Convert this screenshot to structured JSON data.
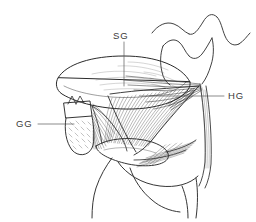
{
  "figure": {
    "background_color": "#ffffff",
    "ink_color": "#2b2b2b",
    "label_color": "#3a3a3a",
    "width": 256,
    "height": 222
  },
  "labels": [
    {
      "id": "sg",
      "text": "SG",
      "meaning": "styloglossus",
      "x": 113,
      "y": 31,
      "leader": {
        "type": "vertical",
        "x1": 124,
        "y1": 42,
        "x2": 124,
        "y2": 86
      }
    },
    {
      "id": "hg",
      "text": "HG",
      "meaning": "hyoglossus",
      "x": 228,
      "y": 91,
      "leader": {
        "type": "horizontal",
        "x1": 224,
        "y1": 96,
        "x2": 150,
        "y2": 96
      }
    },
    {
      "id": "gg",
      "text": "GG",
      "meaning": "genioglossus",
      "x": 16,
      "y": 119,
      "leader": {
        "type": "horizontal",
        "x1": 38,
        "y1": 124,
        "x2": 74,
        "y2": 124
      }
    }
  ],
  "structures": [
    {
      "name": "mandible-outline",
      "kind": "bone"
    },
    {
      "name": "mandible-symphysis-cross-section",
      "kind": "bone"
    },
    {
      "name": "tongue-body-ellipse",
      "kind": "soft-tissue"
    },
    {
      "name": "hyoglossus-fan",
      "kind": "muscle"
    },
    {
      "name": "genioglossus-fan",
      "kind": "muscle"
    },
    {
      "name": "styloglossus-strands",
      "kind": "muscle"
    },
    {
      "name": "stylohyoid-strap",
      "kind": "muscle"
    },
    {
      "name": "hyoid-bone",
      "kind": "bone"
    },
    {
      "name": "neck-contour",
      "kind": "outline"
    }
  ]
}
